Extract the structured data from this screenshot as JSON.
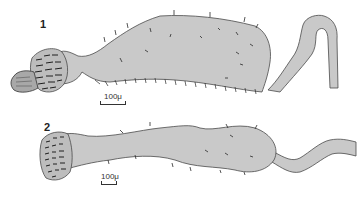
{
  "figures": [
    {
      "label": "1",
      "scale_bar": {
        "text": "100μ"
      }
    },
    {
      "label": "2",
      "scale_bar": {
        "text": "100μ"
      }
    }
  ],
  "colors": {
    "fill": "#c9c9c9",
    "outline": "#4a4a4a",
    "setae": "#2a2a2a",
    "background": "#ffffff"
  }
}
